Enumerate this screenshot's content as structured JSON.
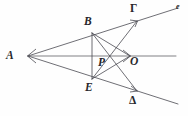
{
  "figure": {
    "background_color": "#fefefe",
    "stroke_color": "#4a4a52",
    "label_color": "#27272b",
    "width": 188,
    "height": 116,
    "labels": [
      {
        "id": "A",
        "text": "A",
        "x": 6,
        "y": 50,
        "size": "main",
        "style": "italic"
      },
      {
        "id": "B",
        "text": "B",
        "x": 84,
        "y": 16,
        "size": "main",
        "style": "italic"
      },
      {
        "id": "Gamma",
        "text": "Γ",
        "x": 130,
        "y": 3,
        "size": "main",
        "style": "upright"
      },
      {
        "id": "e",
        "text": "e",
        "x": 176,
        "y": 3,
        "size": "small",
        "style": "italic"
      },
      {
        "id": "P",
        "text": "P",
        "x": 98,
        "y": 57,
        "size": "main",
        "style": "italic"
      },
      {
        "id": "O",
        "text": "O",
        "x": 130,
        "y": 56,
        "size": "main",
        "style": "italic"
      },
      {
        "id": "E",
        "text": "E",
        "x": 85,
        "y": 82,
        "size": "main",
        "style": "italic"
      },
      {
        "id": "Delta",
        "text": "Δ",
        "x": 129,
        "y": 95,
        "size": "main",
        "style": "upright"
      }
    ],
    "points": {
      "A": [
        28,
        56
      ],
      "B": [
        92,
        33
      ],
      "Gamma": [
        137,
        21
      ],
      "e_end": [
        178,
        8
      ],
      "O": [
        130,
        56
      ],
      "axis_end": [
        176,
        56
      ],
      "P": [
        108,
        56
      ],
      "E": [
        92,
        79
      ],
      "Delta": [
        137,
        91
      ],
      "delta_end": [
        178,
        104
      ]
    },
    "segments": [
      {
        "name": "ray-A-Gamma-e",
        "from": "A",
        "to": "e_end"
      },
      {
        "name": "ray-A-Delta-end",
        "from": "A",
        "to": "delta_end"
      },
      {
        "name": "axis-A-O",
        "from": "A",
        "to": "axis_end"
      },
      {
        "name": "chord-B-E",
        "from": "B",
        "to": "E"
      },
      {
        "name": "chord-B-O",
        "from": "B",
        "to": "O"
      },
      {
        "name": "chord-E-O",
        "from": "E",
        "to": "O"
      },
      {
        "name": "chord-B-Delta",
        "from": "B",
        "to": "Delta"
      },
      {
        "name": "chord-E-Gamma",
        "from": "E",
        "to": "Gamma"
      }
    ],
    "arrowheads": [
      {
        "name": "arrowhead-at-A",
        "x": 28,
        "y": 56,
        "direction": "left"
      },
      {
        "name": "arrowhead-at-O",
        "x": 130,
        "y": 56,
        "direction": "right"
      },
      {
        "name": "arrowhead-at-Gamma",
        "x": 137,
        "y": 21,
        "direction": "up-right"
      },
      {
        "name": "arrowhead-at-Delta",
        "x": 137,
        "y": 91,
        "direction": "down-right"
      }
    ]
  }
}
